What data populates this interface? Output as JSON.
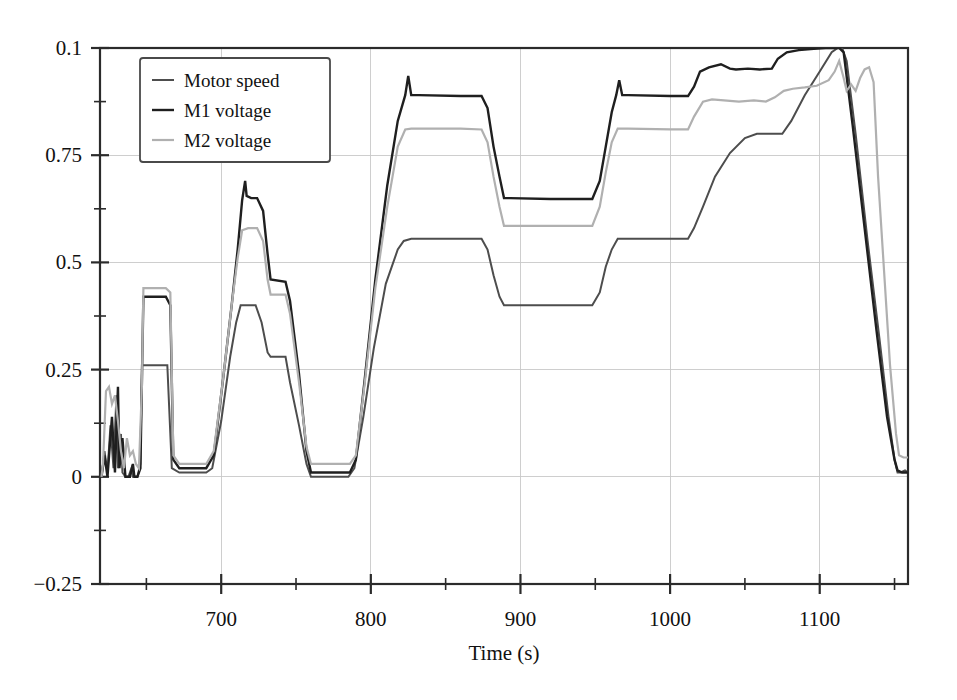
{
  "figure": {
    "background": "#ffffff",
    "plot_background": "#ffffff"
  },
  "axis": {
    "x_title": "Time (s)",
    "y_title": "",
    "x_tick_labels": [
      "700",
      "800",
      "900",
      "1000",
      "1100"
    ],
    "y_tick_labels": [
      "0.1",
      "0.75",
      "0.5",
      "0.25",
      "0",
      "−0.25"
    ]
  },
  "legend": {
    "position": "top-left",
    "entries": [
      {
        "label": "Motor speed",
        "color": "#4d4d4d",
        "width": 2.0
      },
      {
        "label": "M1 voltage",
        "color": "#1f1f1f",
        "width": 2.4
      },
      {
        "label": "M2 voltage",
        "color": "#b0b0b0",
        "width": 2.2
      }
    ]
  },
  "chart_data": {
    "type": "line",
    "title": "",
    "xlabel": "Time (s)",
    "ylabel": "",
    "xlim": [
      619,
      1159
    ],
    "ylim": [
      -0.25,
      1.0
    ],
    "xticks": [
      700,
      800,
      900,
      1000,
      1100
    ],
    "xticklabels": [
      "700",
      "800",
      "900",
      "1000",
      "1100"
    ],
    "xminorticks": [
      650,
      750,
      850,
      950,
      1050,
      1150
    ],
    "yticks": [
      1.0,
      0.75,
      0.5,
      0.25,
      0,
      -0.25
    ],
    "yticklabels": [
      "0.1",
      "0.75",
      "0.5",
      "0.25",
      "0",
      "−0.25"
    ],
    "yminorticks": [
      0.875,
      0.625,
      0.375,
      0.125,
      -0.125
    ],
    "grid": true,
    "grid_axes": "both",
    "legend_position": "upper left",
    "series": [
      {
        "name": "Motor speed",
        "color": "#4d4d4d",
        "linewidth": 2.0,
        "points": [
          [
            620,
            0.0
          ],
          [
            622,
            0.06
          ],
          [
            624,
            0.01
          ],
          [
            626,
            0.12
          ],
          [
            628,
            0.02
          ],
          [
            630,
            0.19
          ],
          [
            631,
            0.02
          ],
          [
            633,
            0.1
          ],
          [
            634,
            0.01
          ],
          [
            636,
            0.0
          ],
          [
            638,
            0.0
          ],
          [
            640,
            0.02
          ],
          [
            641,
            0.0
          ],
          [
            643,
            0.0
          ],
          [
            644,
            0.0
          ],
          [
            646,
            0.03
          ],
          [
            647,
            0.26
          ],
          [
            652,
            0.26
          ],
          [
            664,
            0.26
          ],
          [
            667,
            0.02
          ],
          [
            672,
            0.01
          ],
          [
            690,
            0.01
          ],
          [
            694,
            0.02
          ],
          [
            700,
            0.13
          ],
          [
            706,
            0.28
          ],
          [
            710,
            0.36
          ],
          [
            713,
            0.4
          ],
          [
            723,
            0.4
          ],
          [
            727,
            0.36
          ],
          [
            731,
            0.29
          ],
          [
            733,
            0.28
          ],
          [
            743,
            0.28
          ],
          [
            746,
            0.22
          ],
          [
            752,
            0.12
          ],
          [
            757,
            0.03
          ],
          [
            760,
            0.0
          ],
          [
            762,
            0.0
          ],
          [
            785,
            0.0
          ],
          [
            789,
            0.02
          ],
          [
            795,
            0.14
          ],
          [
            802,
            0.3
          ],
          [
            810,
            0.45
          ],
          [
            818,
            0.53
          ],
          [
            822,
            0.55
          ],
          [
            827,
            0.555
          ],
          [
            833,
            0.555
          ],
          [
            860,
            0.555
          ],
          [
            874,
            0.555
          ],
          [
            878,
            0.53
          ],
          [
            882,
            0.47
          ],
          [
            886,
            0.42
          ],
          [
            889,
            0.4
          ],
          [
            893,
            0.4
          ],
          [
            920,
            0.4
          ],
          [
            948,
            0.4
          ],
          [
            953,
            0.43
          ],
          [
            957,
            0.49
          ],
          [
            961,
            0.53
          ],
          [
            965,
            0.555
          ],
          [
            970,
            0.555
          ],
          [
            1000,
            0.555
          ],
          [
            1012,
            0.555
          ],
          [
            1016,
            0.58
          ],
          [
            1022,
            0.63
          ],
          [
            1030,
            0.7
          ],
          [
            1040,
            0.755
          ],
          [
            1050,
            0.79
          ],
          [
            1058,
            0.8
          ],
          [
            1065,
            0.8
          ],
          [
            1075,
            0.8
          ],
          [
            1081,
            0.83
          ],
          [
            1090,
            0.89
          ],
          [
            1100,
            0.945
          ],
          [
            1108,
            0.99
          ],
          [
            1112,
            1.0
          ],
          [
            1115,
            1.0
          ],
          [
            1118,
            0.97
          ],
          [
            1124,
            0.8
          ],
          [
            1132,
            0.55
          ],
          [
            1140,
            0.32
          ],
          [
            1146,
            0.14
          ],
          [
            1150,
            0.04
          ],
          [
            1152,
            0.01
          ],
          [
            1154,
            0.01
          ],
          [
            1157,
            0.015
          ],
          [
            1159,
            0.01
          ]
        ]
      },
      {
        "name": "M1 voltage",
        "color": "#1f1f1f",
        "linewidth": 2.4,
        "points": [
          [
            620,
            0.0
          ],
          [
            622,
            0.05
          ],
          [
            624,
            0.0
          ],
          [
            627,
            0.14
          ],
          [
            629,
            0.01
          ],
          [
            631,
            0.21
          ],
          [
            632,
            0.02
          ],
          [
            634,
            0.09
          ],
          [
            636,
            0.0
          ],
          [
            639,
            0.0
          ],
          [
            641,
            0.03
          ],
          [
            642,
            0.0
          ],
          [
            644,
            0.0
          ],
          [
            646,
            0.02
          ],
          [
            648,
            0.42
          ],
          [
            652,
            0.42
          ],
          [
            663,
            0.42
          ],
          [
            666,
            0.4
          ],
          [
            668,
            0.04
          ],
          [
            672,
            0.02
          ],
          [
            690,
            0.02
          ],
          [
            695,
            0.05
          ],
          [
            701,
            0.22
          ],
          [
            707,
            0.4
          ],
          [
            711,
            0.53
          ],
          [
            714,
            0.645
          ],
          [
            716,
            0.69
          ],
          [
            717,
            0.655
          ],
          [
            720,
            0.65
          ],
          [
            724,
            0.65
          ],
          [
            728,
            0.62
          ],
          [
            731,
            0.52
          ],
          [
            733,
            0.46
          ],
          [
            743,
            0.455
          ],
          [
            746,
            0.41
          ],
          [
            752,
            0.24
          ],
          [
            757,
            0.06
          ],
          [
            760,
            0.01
          ],
          [
            763,
            0.01
          ],
          [
            786,
            0.01
          ],
          [
            790,
            0.04
          ],
          [
            796,
            0.23
          ],
          [
            803,
            0.46
          ],
          [
            811,
            0.68
          ],
          [
            818,
            0.83
          ],
          [
            823,
            0.89
          ],
          [
            825,
            0.935
          ],
          [
            827,
            0.89
          ],
          [
            832,
            0.89
          ],
          [
            860,
            0.888
          ],
          [
            874,
            0.888
          ],
          [
            878,
            0.86
          ],
          [
            882,
            0.77
          ],
          [
            886,
            0.7
          ],
          [
            889,
            0.65
          ],
          [
            893,
            0.65
          ],
          [
            920,
            0.648
          ],
          [
            948,
            0.648
          ],
          [
            953,
            0.69
          ],
          [
            957,
            0.77
          ],
          [
            961,
            0.85
          ],
          [
            964,
            0.89
          ],
          [
            966,
            0.925
          ],
          [
            968,
            0.89
          ],
          [
            972,
            0.89
          ],
          [
            1000,
            0.888
          ],
          [
            1012,
            0.888
          ],
          [
            1016,
            0.91
          ],
          [
            1020,
            0.945
          ],
          [
            1026,
            0.955
          ],
          [
            1034,
            0.962
          ],
          [
            1040,
            0.952
          ],
          [
            1044,
            0.95
          ],
          [
            1052,
            0.952
          ],
          [
            1060,
            0.95
          ],
          [
            1068,
            0.952
          ],
          [
            1072,
            0.975
          ],
          [
            1078,
            0.99
          ],
          [
            1086,
            0.995
          ],
          [
            1096,
            0.998
          ],
          [
            1104,
            1.0
          ],
          [
            1110,
            1.0
          ],
          [
            1113,
            1.0
          ],
          [
            1116,
            0.99
          ],
          [
            1122,
            0.82
          ],
          [
            1130,
            0.58
          ],
          [
            1138,
            0.34
          ],
          [
            1145,
            0.14
          ],
          [
            1150,
            0.04
          ],
          [
            1152,
            0.015
          ],
          [
            1155,
            0.01
          ],
          [
            1159,
            0.01
          ]
        ]
      },
      {
        "name": "M2 voltage",
        "color": "#b0b0b0",
        "linewidth": 2.2,
        "points": [
          [
            620,
            0.0
          ],
          [
            621,
            0.03
          ],
          [
            623,
            0.2
          ],
          [
            625,
            0.21
          ],
          [
            627,
            0.17
          ],
          [
            629,
            0.19
          ],
          [
            631,
            0.13
          ],
          [
            633,
            0.06
          ],
          [
            635,
            0.02
          ],
          [
            637,
            0.09
          ],
          [
            639,
            0.05
          ],
          [
            641,
            0.06
          ],
          [
            643,
            0.03
          ],
          [
            645,
            0.02
          ],
          [
            647,
            0.21
          ],
          [
            648,
            0.44
          ],
          [
            652,
            0.44
          ],
          [
            663,
            0.44
          ],
          [
            666,
            0.43
          ],
          [
            668,
            0.05
          ],
          [
            672,
            0.03
          ],
          [
            690,
            0.03
          ],
          [
            695,
            0.06
          ],
          [
            701,
            0.22
          ],
          [
            707,
            0.4
          ],
          [
            711,
            0.51
          ],
          [
            714,
            0.575
          ],
          [
            718,
            0.58
          ],
          [
            724,
            0.58
          ],
          [
            728,
            0.55
          ],
          [
            731,
            0.46
          ],
          [
            733,
            0.425
          ],
          [
            743,
            0.425
          ],
          [
            746,
            0.38
          ],
          [
            752,
            0.22
          ],
          [
            757,
            0.07
          ],
          [
            760,
            0.03
          ],
          [
            763,
            0.03
          ],
          [
            786,
            0.03
          ],
          [
            790,
            0.05
          ],
          [
            796,
            0.22
          ],
          [
            803,
            0.44
          ],
          [
            811,
            0.63
          ],
          [
            818,
            0.77
          ],
          [
            823,
            0.81
          ],
          [
            827,
            0.812
          ],
          [
            860,
            0.812
          ],
          [
            874,
            0.81
          ],
          [
            878,
            0.78
          ],
          [
            882,
            0.7
          ],
          [
            886,
            0.63
          ],
          [
            889,
            0.585
          ],
          [
            893,
            0.585
          ],
          [
            920,
            0.585
          ],
          [
            948,
            0.585
          ],
          [
            953,
            0.63
          ],
          [
            957,
            0.71
          ],
          [
            961,
            0.78
          ],
          [
            965,
            0.812
          ],
          [
            972,
            0.812
          ],
          [
            1000,
            0.81
          ],
          [
            1012,
            0.81
          ],
          [
            1016,
            0.84
          ],
          [
            1022,
            0.875
          ],
          [
            1028,
            0.88
          ],
          [
            1036,
            0.878
          ],
          [
            1046,
            0.875
          ],
          [
            1056,
            0.878
          ],
          [
            1064,
            0.875
          ],
          [
            1070,
            0.885
          ],
          [
            1076,
            0.9
          ],
          [
            1082,
            0.905
          ],
          [
            1090,
            0.908
          ],
          [
            1098,
            0.912
          ],
          [
            1106,
            0.925
          ],
          [
            1110,
            0.945
          ],
          [
            1113,
            0.97
          ],
          [
            1116,
            0.93
          ],
          [
            1118,
            0.9
          ],
          [
            1121,
            0.915
          ],
          [
            1124,
            0.9
          ],
          [
            1127,
            0.93
          ],
          [
            1130,
            0.95
          ],
          [
            1133,
            0.955
          ],
          [
            1136,
            0.92
          ],
          [
            1139,
            0.7
          ],
          [
            1143,
            0.48
          ],
          [
            1147,
            0.26
          ],
          [
            1151,
            0.1
          ],
          [
            1153,
            0.05
          ],
          [
            1156,
            0.045
          ],
          [
            1159,
            0.045
          ]
        ]
      }
    ]
  }
}
